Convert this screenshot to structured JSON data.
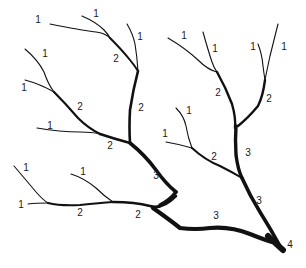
{
  "diagram": {
    "type": "stream-order-tree",
    "stroke_color": "#111111",
    "background": "#ffffff",
    "labels": [
      {
        "id": "l1",
        "text": "1",
        "x": 38,
        "y": 20
      },
      {
        "id": "l2",
        "text": "1",
        "x": 96,
        "y": 14
      },
      {
        "id": "l3",
        "text": "1",
        "x": 140,
        "y": 37
      },
      {
        "id": "l4",
        "text": "2",
        "x": 116,
        "y": 59
      },
      {
        "id": "l5",
        "text": "1",
        "x": 45,
        "y": 54
      },
      {
        "id": "l6",
        "text": "1",
        "x": 24,
        "y": 88
      },
      {
        "id": "l7",
        "text": "2",
        "x": 80,
        "y": 107
      },
      {
        "id": "l8",
        "text": "2",
        "x": 141,
        "y": 108
      },
      {
        "id": "l9",
        "text": "1",
        "x": 50,
        "y": 126
      },
      {
        "id": "l10",
        "text": "2",
        "x": 110,
        "y": 146
      },
      {
        "id": "l11",
        "text": "3",
        "x": 156,
        "y": 176
      },
      {
        "id": "l12",
        "text": "1",
        "x": 26,
        "y": 168
      },
      {
        "id": "l13",
        "text": "1",
        "x": 21,
        "y": 205
      },
      {
        "id": "l14",
        "text": "1",
        "x": 83,
        "y": 172
      },
      {
        "id": "l15",
        "text": "2",
        "x": 80,
        "y": 213
      },
      {
        "id": "l16",
        "text": "2",
        "x": 138,
        "y": 215
      },
      {
        "id": "l17",
        "text": "3",
        "x": 216,
        "y": 216
      },
      {
        "id": "l18",
        "text": "4",
        "x": 290,
        "y": 245
      },
      {
        "id": "l19",
        "text": "1",
        "x": 184,
        "y": 36
      },
      {
        "id": "l20",
        "text": "1",
        "x": 215,
        "y": 49
      },
      {
        "id": "l21",
        "text": "2",
        "x": 218,
        "y": 93
      },
      {
        "id": "l22",
        "text": "1",
        "x": 253,
        "y": 47
      },
      {
        "id": "l23",
        "text": "1",
        "x": 284,
        "y": 47
      },
      {
        "id": "l24",
        "text": "2",
        "x": 269,
        "y": 99
      },
      {
        "id": "l25",
        "text": "3",
        "x": 248,
        "y": 153
      },
      {
        "id": "l26",
        "text": "1",
        "x": 189,
        "y": 111
      },
      {
        "id": "l27",
        "text": "1",
        "x": 165,
        "y": 134
      },
      {
        "id": "l28",
        "text": "2",
        "x": 214,
        "y": 157
      },
      {
        "id": "l29",
        "text": "3",
        "x": 259,
        "y": 201
      }
    ]
  }
}
